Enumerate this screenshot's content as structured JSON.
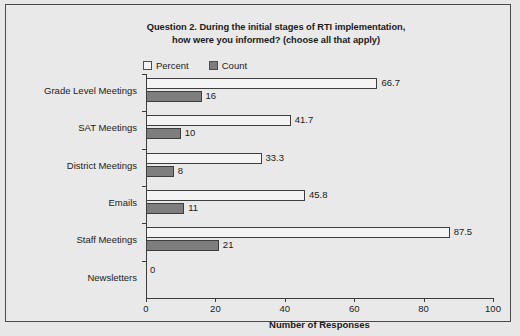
{
  "chart_data": {
    "type": "bar",
    "orientation": "horizontal",
    "title": "Question 2. During the initial stages of RTI implementation, how were you informed? (choose all that apply)",
    "title_lines": [
      "Question 2. During the initial stages of RTI implementation,",
      "how were you informed? (choose all that apply)"
    ],
    "categories": [
      "Grade Level Meetings",
      "SAT Meetings",
      "District Meetings",
      "Emails",
      "Staff Meetings",
      "Newsletters"
    ],
    "series": [
      {
        "name": "Percent",
        "color": "#f4f4f4",
        "values": [
          66.7,
          41.7,
          33.3,
          45.8,
          87.5,
          0
        ],
        "labels": [
          "66.7",
          "41.7",
          "33.3",
          "45.8",
          "87.5",
          "0"
        ]
      },
      {
        "name": "Count",
        "color": "#7e7e7e",
        "values": [
          16,
          10,
          8,
          11,
          21,
          0
        ],
        "labels": [
          "16",
          "10",
          "8",
          "11",
          "21",
          ""
        ]
      }
    ],
    "xlabel": "Number of Responses",
    "ylabel": "",
    "xlim": [
      0,
      100
    ],
    "xticks": [
      0,
      20,
      40,
      60,
      80,
      100
    ],
    "xtick_labels": [
      "0",
      "20",
      "40",
      "60",
      "80",
      "100"
    ],
    "grid": false,
    "legend_position": "top-left",
    "legend": [
      "Percent",
      "Count"
    ]
  },
  "legend": {
    "percent_label": "Percent",
    "count_label": "Count"
  },
  "axis": {
    "x_title": "Number of Responses"
  }
}
